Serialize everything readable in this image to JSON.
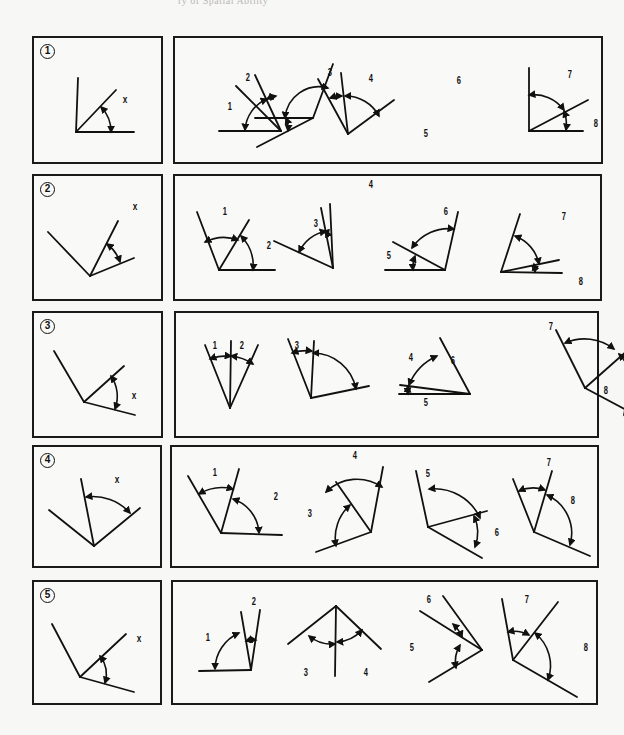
{
  "header": {
    "text": "ry of Spatial Ability"
  },
  "rows": [
    {
      "number": "1",
      "left_box": {
        "x": 32,
        "y": 36,
        "w": 131,
        "h": 128
      },
      "right_box": {
        "x": 173,
        "y": 36,
        "w": 430,
        "h": 128
      },
      "reference": {
        "label": "x",
        "label_pos": [
          88,
          55
        ],
        "lines": [
          [
            42,
            94,
            44,
            40
          ],
          [
            42,
            94,
            100,
            94
          ],
          [
            42,
            94,
            82,
            52
          ]
        ],
        "arcs": [
          [
            "M 67 69 A 35 35 0 0 1 77 94"
          ]
        ]
      },
      "options": {
        "labels": [
          {
            "t": "1",
            "x": 52,
            "y": 63
          },
          {
            "t": "2",
            "x": 70,
            "y": 34
          },
          {
            "t": "3",
            "x": 152,
            "y": 29
          },
          {
            "t": "4",
            "x": 193,
            "y": 35
          },
          {
            "t": "5",
            "x": 248,
            "y": 90
          },
          {
            "t": "6",
            "x": 281,
            "y": 37
          },
          {
            "t": "7",
            "x": 392,
            "y": 31
          },
          {
            "t": "8",
            "x": 418,
            "y": 80
          }
        ],
        "lines": [
          [
            44,
            93,
            106,
            93
          ],
          [
            106,
            93,
            61,
            48
          ],
          [
            106,
            93,
            80,
            37
          ],
          [
            173,
            96,
            143,
            41
          ],
          [
            173,
            96,
            166,
            35
          ],
          [
            173,
            96,
            219,
            62
          ],
          [
            80,
            80,
            138,
            80
          ],
          [
            138,
            80,
            82,
            109
          ],
          [
            138,
            80,
            158,
            26
          ],
          [
            354,
            93,
            354,
            30
          ],
          [
            354,
            93,
            408,
            93
          ],
          [
            354,
            93,
            413,
            62
          ]
        ],
        "arcs": [
          "M 70 92 A 36 36 0 0 1 92 61",
          "M 92 61 A 36 36 0 0 1 101 58",
          "M 155 60 A 38 38 0 0 1 167 58",
          "M 170 58 A 38 38 0 0 1 204 78",
          "M 111 80 A 27 27 0 0 1 113 93",
          "M 110 80 A 34 34 0 0 1 153 50",
          "M 354 57 A 37 37 0 0 1 389 72",
          "M 389 73 A 37 37 0 0 1 391 92"
        ]
      }
    },
    {
      "number": "2",
      "left_box": {
        "x": 32,
        "y": 174,
        "w": 131,
        "h": 127
      },
      "right_box": {
        "x": 173,
        "y": 174,
        "w": 429,
        "h": 127
      },
      "reference": {
        "label": "x",
        "label_pos": [
          98,
          24
        ],
        "lines": [
          [
            56,
            100,
            14,
            56
          ],
          [
            56,
            100,
            84,
            45
          ],
          [
            56,
            100,
            100,
            82
          ]
        ],
        "arcs": [
          [
            "M 73 68 A 37 37 0 0 1 86 86"
          ]
        ]
      },
      "options": {
        "labels": [
          {
            "t": "1",
            "x": 47,
            "y": 30
          },
          {
            "t": "2",
            "x": 91,
            "y": 64
          },
          {
            "t": "3",
            "x": 138,
            "y": 42
          },
          {
            "t": "4",
            "x": 193,
            "y": 3
          },
          {
            "t": "5",
            "x": 211,
            "y": 74
          },
          {
            "t": "6",
            "x": 268,
            "y": 30
          },
          {
            "t": "7",
            "x": 386,
            "y": 35
          },
          {
            "t": "8",
            "x": 403,
            "y": 100
          }
        ],
        "lines": [
          [
            44,
            94,
            22,
            36
          ],
          [
            44,
            94,
            74,
            44
          ],
          [
            44,
            94,
            100,
            94
          ],
          [
            158,
            92,
            99,
            65
          ],
          [
            158,
            92,
            155,
            28
          ],
          [
            158,
            92,
            146,
            32
          ],
          [
            210,
            94,
            270,
            94
          ],
          [
            270,
            94,
            218,
            66
          ],
          [
            270,
            94,
            283,
            36
          ],
          [
            326,
            96,
            345,
            38
          ],
          [
            326,
            96,
            387,
            97
          ],
          [
            326,
            96,
            384,
            84
          ]
        ],
        "arcs": [
          "M 30 66 A 42 42 0 0 1 63 64",
          "M 66 60 A 43 43 0 0 1 78 94",
          "M 124 76 A 40 40 0 0 1 151 55",
          "M 151 55 A 40 40 0 0 1 153 60",
          "M 238 94 A 32 32 0 0 1 240 80",
          "M 237 72 A 44 44 0 0 1 279 53",
          "M 340 60 A 38 38 0 0 1 364 88",
          "M 359 88 A 34 34 0 0 1 360 96"
        ]
      }
    },
    {
      "number": "3",
      "left_box": {
        "x": 32,
        "y": 311,
        "w": 131,
        "h": 127
      },
      "right_box": {
        "x": 174,
        "y": 311,
        "w": 425,
        "h": 127
      },
      "reference": {
        "label": "x",
        "label_pos": [
          97,
          76
        ],
        "lines": [
          [
            50,
            89,
            20,
            38
          ],
          [
            50,
            89,
            90,
            53
          ],
          [
            50,
            89,
            101,
            102
          ]
        ],
        "arcs": [
          [
            "M 77 63 A 36 36 0 0 1 81 96"
          ]
        ]
      },
      "options": {
        "labels": [
          {
            "t": "1",
            "x": 36,
            "y": 27
          },
          {
            "t": "2",
            "x": 63,
            "y": 27
          },
          {
            "t": "3",
            "x": 118,
            "y": 27
          },
          {
            "t": "4",
            "x": 232,
            "y": 39
          },
          {
            "t": "5",
            "x": 247,
            "y": 84
          },
          {
            "t": "6",
            "x": 274,
            "y": 42
          },
          {
            "t": "7",
            "x": 372,
            "y": 8
          },
          {
            "t": "8",
            "x": 427,
            "y": 72
          }
        ],
        "lines": [
          [
            54,
            95,
            29,
            32
          ],
          [
            54,
            95,
            55,
            28
          ],
          [
            54,
            95,
            82,
            32
          ],
          [
            135,
            85,
            112,
            26
          ],
          [
            135,
            85,
            138,
            28
          ],
          [
            135,
            85,
            193,
            73
          ],
          [
            223,
            81,
            294,
            81
          ],
          [
            294,
            81,
            224,
            72
          ],
          [
            294,
            81,
            264,
            25
          ],
          [
            409,
            75,
            380,
            17
          ],
          [
            409,
            75,
            461,
            29
          ],
          [
            409,
            75,
            467,
            106
          ]
        ],
        "arcs": [
          "M 34 46 A 48 48 0 0 1 55 43",
          "M 55 43 A 48 48 0 0 1 77 51",
          "M 116 40 A 46 46 0 0 1 136 38",
          "M 137 40 A 44 44 0 0 1 180 76",
          "M 232 81 A 55 55 0 0 1 232 73",
          "M 233 72 A 54 54 0 0 1 261 43",
          "M 389 30 A 48 48 0 0 1 438 36",
          "M 443 41 A 49 49 0 0 1 448 102"
        ]
      }
    },
    {
      "number": "4",
      "left_box": {
        "x": 32,
        "y": 445,
        "w": 130,
        "h": 123
      },
      "right_box": {
        "x": 170,
        "y": 445,
        "w": 429,
        "h": 123
      },
      "reference": {
        "label": "x",
        "label_pos": [
          80,
          26
        ],
        "lines": [
          [
            60,
            99,
            15,
            63
          ],
          [
            60,
            99,
            47,
            32
          ],
          [
            60,
            99,
            106,
            61
          ]
        ],
        "arcs": [
          [
            "M 52 50 A 50 50 0 0 1 96 66"
          ]
        ]
      },
      "options": {
        "labels": [
          {
            "t": "1",
            "x": 40,
            "y": 20
          },
          {
            "t": "2",
            "x": 101,
            "y": 44
          },
          {
            "t": "3",
            "x": 135,
            "y": 61
          },
          {
            "t": "4",
            "x": 180,
            "y": 3
          },
          {
            "t": "5",
            "x": 253,
            "y": 21
          },
          {
            "t": "6",
            "x": 322,
            "y": 80
          },
          {
            "t": "7",
            "x": 374,
            "y": 10
          },
          {
            "t": "8",
            "x": 398,
            "y": 48
          }
        ],
        "lines": [
          [
            49,
            86,
            16,
            29
          ],
          [
            49,
            86,
            67,
            22
          ],
          [
            49,
            86,
            110,
            88
          ],
          [
            199,
            85,
            144,
            105
          ],
          [
            199,
            85,
            164,
            35
          ],
          [
            199,
            85,
            211,
            20
          ],
          [
            256,
            80,
            244,
            24
          ],
          [
            256,
            80,
            315,
            64
          ],
          [
            256,
            80,
            310,
            111
          ],
          [
            362,
            85,
            341,
            32
          ],
          [
            362,
            85,
            380,
            24
          ],
          [
            362,
            85,
            418,
            109
          ]
        ],
        "arcs": [
          "M 27 47 A 45 45 0 0 1 61 42",
          "M 61 52 A 38 38 0 0 1 87 86",
          "M 154 45 A 44 44 0 0 1 210 40",
          "M 178 58 A 44 44 0 0 0 164 99",
          "M 257 42 A 50 50 0 0 1 308 71",
          "M 302 69 A 40 40 0 0 1 303 100",
          "M 347 44 A 35 35 0 0 1 373 43",
          "M 375 48 A 42 42 0 0 1 398 98"
        ]
      }
    },
    {
      "number": "5",
      "left_box": {
        "x": 32,
        "y": 580,
        "w": 130,
        "h": 125
      },
      "right_box": {
        "x": 171,
        "y": 580,
        "w": 427,
        "h": 125
      },
      "reference": {
        "label": "x",
        "label_pos": [
          102,
          50
        ],
        "lines": [
          [
            46,
            95,
            18,
            42
          ],
          [
            46,
            95,
            92,
            52
          ],
          [
            46,
            95,
            100,
            110
          ]
        ],
        "arcs": [
          [
            "M 66 74 A 30 30 0 0 1 71 101"
          ]
        ]
      },
      "options": {
        "labels": [
          {
            "t": "1",
            "x": 32,
            "y": 50
          },
          {
            "t": "2",
            "x": 78,
            "y": 14
          },
          {
            "t": "3",
            "x": 130,
            "y": 85
          },
          {
            "t": "4",
            "x": 190,
            "y": 85
          },
          {
            "t": "5",
            "x": 236,
            "y": 60
          },
          {
            "t": "6",
            "x": 253,
            "y": 12
          },
          {
            "t": "7",
            "x": 351,
            "y": 12
          },
          {
            "t": "8",
            "x": 410,
            "y": 60
          }
        ],
        "lines": [
          [
            26,
            89,
            78,
            88
          ],
          [
            78,
            88,
            68,
            30
          ],
          [
            78,
            88,
            87,
            28
          ],
          [
            163,
            24,
            115,
            62
          ],
          [
            163,
            24,
            208,
            67
          ],
          [
            163,
            24,
            162,
            94
          ],
          [
            247,
            29,
            309,
            68
          ],
          [
            309,
            68,
            270,
            14
          ],
          [
            309,
            68,
            256,
            100
          ],
          [
            340,
            78,
            329,
            17
          ],
          [
            340,
            78,
            385,
            20
          ],
          [
            340,
            78,
            404,
            115
          ]
        ],
        "arcs": [
          "M 42 87 A 40 40 0 0 1 66 51",
          "M 73 59 A 27 27 0 0 1 83 58",
          "M 136 54 A 36 36 0 0 0 162 62",
          "M 164 60 A 36 36 0 0 0 189 48",
          "M 280 42 A 36 36 0 0 1 289 55",
          "M 287 63 A 32 32 0 0 0 283 86",
          "M 335 50 A 30 30 0 0 1 356 53",
          "M 362 51 A 42 42 0 0 1 375 98"
        ]
      }
    }
  ]
}
